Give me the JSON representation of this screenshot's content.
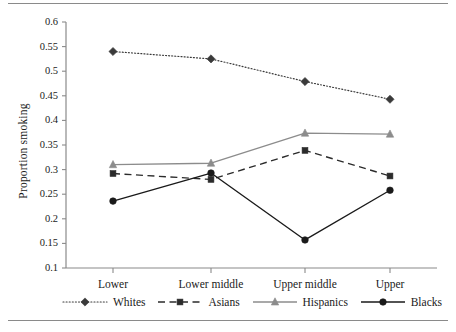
{
  "chart_data": {
    "type": "line",
    "title": "",
    "xlabel": "",
    "ylabel": "Proportion smoking",
    "categories": [
      "Lower",
      "Lower middle",
      "Upper middle",
      "Upper"
    ],
    "ylim": [
      0.1,
      0.6
    ],
    "yticks": [
      "0.1",
      "0.15",
      "0.2",
      "0.25",
      "0.3",
      "0.35",
      "0.4",
      "0.45",
      "0.5",
      "0.55",
      "0.6"
    ],
    "ytick_values": [
      0.1,
      0.15,
      0.2,
      0.25,
      0.3,
      0.35,
      0.4,
      0.45,
      0.5,
      0.55,
      0.6
    ],
    "grid": false,
    "legend_position": "bottom",
    "series": [
      {
        "name": "Whites",
        "values": [
          0.54,
          0.525,
          0.479,
          0.443
        ],
        "color": "#3a3a3a",
        "linestyle": "dotted",
        "marker": "diamond"
      },
      {
        "name": "Asians",
        "values": [
          0.292,
          0.28,
          0.339,
          0.287
        ],
        "color": "#2b2b2b",
        "linestyle": "dashed",
        "marker": "square"
      },
      {
        "name": "Hispanics",
        "values": [
          0.31,
          0.313,
          0.374,
          0.372
        ],
        "color": "#8c8c8c",
        "linestyle": "solid",
        "marker": "triangle"
      },
      {
        "name": "Blacks",
        "values": [
          0.236,
          0.293,
          0.157,
          0.258
        ],
        "color": "#1a1a1a",
        "linestyle": "solid",
        "marker": "circle"
      }
    ]
  },
  "axis": {
    "color": "#8a8a8a"
  },
  "rules": {
    "color": "#8a8a8a"
  }
}
